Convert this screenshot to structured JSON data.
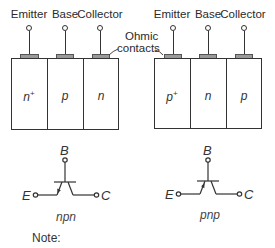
{
  "diagram": {
    "npn_structure": {
      "terminals": [
        {
          "label": "Emitter",
          "x": 29
        },
        {
          "label": "Base",
          "x": 65
        },
        {
          "label": "Collector",
          "x": 100
        }
      ],
      "regions": [
        {
          "label": "n",
          "superscript": "+"
        },
        {
          "label": "p",
          "superscript": ""
        },
        {
          "label": "n",
          "superscript": ""
        }
      ]
    },
    "pnp_structure": {
      "terminals": [
        {
          "label": "Emitter",
          "x": 172
        },
        {
          "label": "Base",
          "x": 208
        },
        {
          "label": "Collector",
          "x": 243
        }
      ],
      "regions": [
        {
          "label": "p",
          "superscript": "+"
        },
        {
          "label": "n",
          "superscript": ""
        },
        {
          "label": "p",
          "superscript": ""
        }
      ]
    },
    "annotation": {
      "line1": "Ohmic",
      "line2": "contacts"
    },
    "npn_symbol": {
      "base": "B",
      "emitter": "E",
      "collector": "C",
      "type": "npn",
      "arrow": "outward"
    },
    "pnp_symbol": {
      "base": "B",
      "emitter": "E",
      "collector": "C",
      "type": "pnp",
      "arrow": "inward"
    },
    "note_label": "Note:",
    "colors": {
      "line": "#333333",
      "contact_fill": "#9a9a9a",
      "background": "#ffffff"
    }
  }
}
